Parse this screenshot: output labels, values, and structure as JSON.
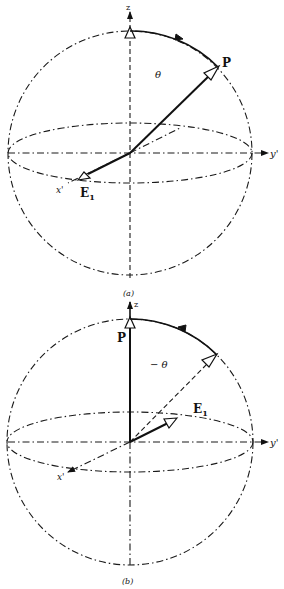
{
  "figure": {
    "panels": [
      {
        "id": "a",
        "caption": "(a)",
        "axes": {
          "z": "z",
          "y": "y'",
          "x": "x'"
        },
        "vectors": {
          "P": "P",
          "E": "E",
          "E_sub": "1"
        },
        "angle_label": "θ",
        "description": "Sphere with vector P tilted from z-axis by angle θ toward y', vector E₁ along x' axis; arc arrow from z toward P"
      },
      {
        "id": "b",
        "caption": "(b)",
        "axes": {
          "z": "z",
          "y": "y'",
          "x": "x'"
        },
        "vectors": {
          "P": "P",
          "E": "E",
          "E_sub": "1"
        },
        "angle_label": "− θ",
        "description": "Sphere with vector P along z-axis, dashed former direction, vector E₁ rotated into y'-z plane; arc arrow from P-side back toward z"
      }
    ],
    "colors": {
      "ink": "#111111",
      "background": "#ffffff"
    }
  }
}
